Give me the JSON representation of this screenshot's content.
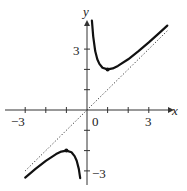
{
  "chart_data": {
    "type": "line",
    "title": "",
    "function": "y = x + 1/x",
    "xlabel": "x",
    "ylabel": "y",
    "xlim": [
      -3.2,
      3.9
    ],
    "ylim": [
      -3.2,
      4.6
    ],
    "x_tick_labels": [
      "-3",
      "0",
      "3"
    ],
    "y_tick_labels": [
      "3",
      "-3"
    ],
    "x_ticks": [
      -3,
      -2,
      -1,
      1,
      2,
      3
    ],
    "y_ticks": [
      -3,
      -2,
      -1,
      1,
      2,
      3
    ],
    "grid": false,
    "legend": "none",
    "series": [
      {
        "name": "curve-right-branch",
        "style": "solid",
        "x": [
          0.24,
          0.3,
          0.4,
          0.5,
          0.6,
          0.75,
          1.0,
          1.25,
          1.5,
          2.0,
          2.5,
          3.0,
          3.5,
          3.9
        ],
        "y": [
          4.41,
          3.63,
          2.9,
          2.5,
          2.27,
          2.08,
          2.0,
          2.05,
          2.17,
          2.5,
          2.9,
          3.33,
          3.79,
          4.16
        ]
      },
      {
        "name": "curve-left-branch",
        "style": "solid",
        "x": [
          -3.0,
          -2.5,
          -2.0,
          -1.5,
          -1.25,
          -1.0,
          -0.75,
          -0.6,
          -0.5,
          -0.4,
          -0.33
        ],
        "y": [
          -3.33,
          -2.9,
          -2.5,
          -2.17,
          -2.05,
          -2.0,
          -2.08,
          -2.27,
          -2.5,
          -2.9,
          -3.36
        ]
      },
      {
        "name": "asymptote y=x",
        "style": "dotted",
        "x": [
          -3.0,
          3.9
        ],
        "y": [
          -3.0,
          3.9
        ]
      }
    ],
    "annotations": [
      {
        "type": "point",
        "x": 1,
        "y": 2,
        "label": "local minimum"
      },
      {
        "type": "point",
        "x": -1,
        "y": -2,
        "label": "local maximum"
      }
    ]
  },
  "labels": {
    "x_axis": "x",
    "y_axis": "y",
    "x_neg3": "−3",
    "x_zero": "0",
    "x_pos3": "3",
    "y_pos3": "3",
    "y_neg3": "−3"
  },
  "colors": {
    "curve": "#111111",
    "axes": "#333333",
    "asymptote": "#333333"
  }
}
